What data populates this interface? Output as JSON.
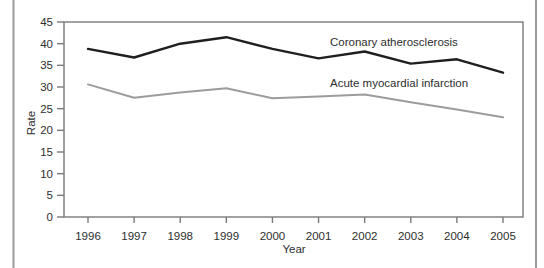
{
  "figure": {
    "type": "scanned-line-chart",
    "background": "#ffffff",
    "page_border_color": "#9a9a9a",
    "frame_color": "#7a7a7a",
    "text_color": "#2e2e2e"
  },
  "chart_data": {
    "type": "line",
    "title": "",
    "xlabel": "Year",
    "ylabel": "Rate",
    "x": [
      1996,
      1997,
      1998,
      1999,
      2000,
      2001,
      2002,
      2003,
      2004,
      2005
    ],
    "series": [
      {
        "name": "Coronary atherosclerosis",
        "color": "#1f1f1f",
        "stroke_width": 2.4,
        "values": [
          38.8,
          36.8,
          40.0,
          41.5,
          38.8,
          36.6,
          38.2,
          35.4,
          36.4,
          33.3
        ]
      },
      {
        "name": "Acute myocardial infarction",
        "color": "#9c9c9c",
        "stroke_width": 2.0,
        "values": [
          30.6,
          27.5,
          28.7,
          29.7,
          27.4,
          27.8,
          28.3,
          26.5,
          24.8,
          23.0
        ]
      }
    ],
    "ylim": [
      0,
      45
    ],
    "yticks": [
      0,
      5,
      10,
      15,
      20,
      25,
      30,
      35,
      40,
      45
    ],
    "grid": false,
    "legend_position": "inline-annotations"
  }
}
